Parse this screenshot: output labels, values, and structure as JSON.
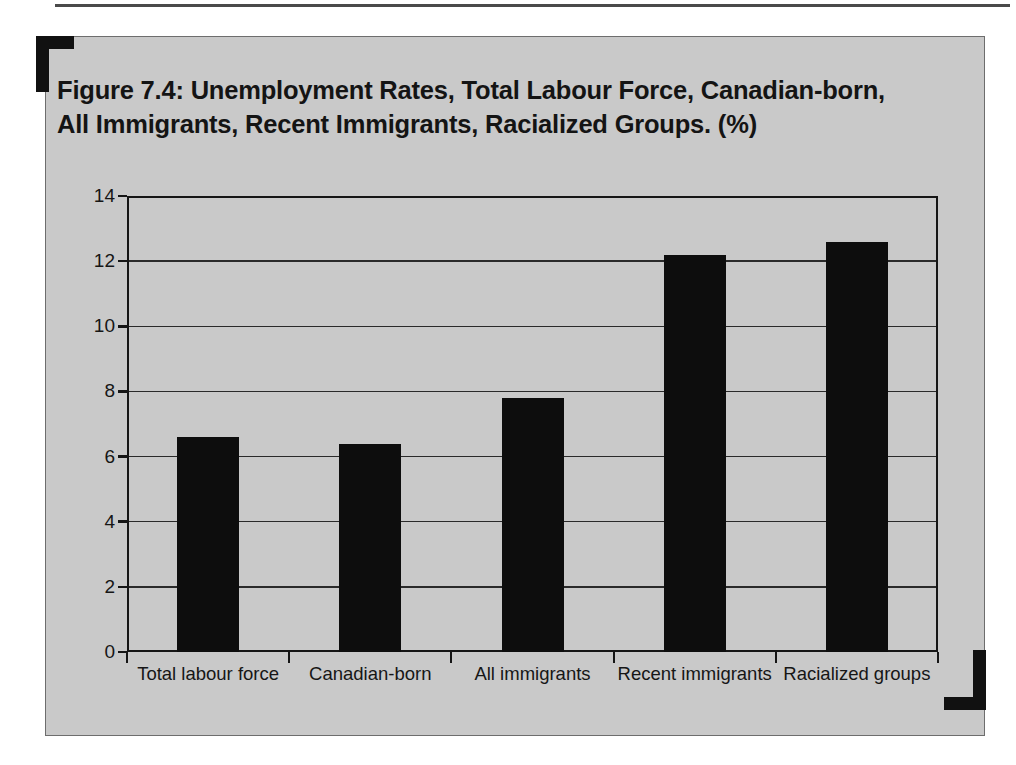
{
  "figure": {
    "title": "Figure 7.4: Unemployment Rates, Total Labour Force, Canadian-born, All Immigrants, Recent Immigrants, Racialized Groups. (%)",
    "panel_color": "#c9c9c9",
    "bar_color": "#0d0d0d",
    "axis_color": "#151515"
  },
  "chart_data": {
    "type": "bar",
    "title": "Figure 7.4: Unemployment Rates, Total Labour Force, Canadian-born, All Immigrants, Recent Immigrants, Racialized Groups. (%)",
    "xlabel": "",
    "ylabel": "",
    "categories": [
      "Total labour force",
      "Canadian-born",
      "All immigrants",
      "Recent immigrants",
      "Racialized groups"
    ],
    "values": [
      6.6,
      6.4,
      7.8,
      12.2,
      12.6
    ],
    "ylim": [
      0,
      14
    ],
    "yticks": [
      0,
      2,
      4,
      6,
      8,
      10,
      12,
      14
    ],
    "ytick_labels": [
      "0",
      "2",
      "4",
      "6",
      "8",
      "10",
      "12",
      "14"
    ],
    "grid": true,
    "grid_axis": "y",
    "legend": false,
    "series": [
      {
        "name": "Unemployment rate (%)",
        "values": [
          6.6,
          6.4,
          7.8,
          12.2,
          12.6
        ]
      }
    ]
  }
}
